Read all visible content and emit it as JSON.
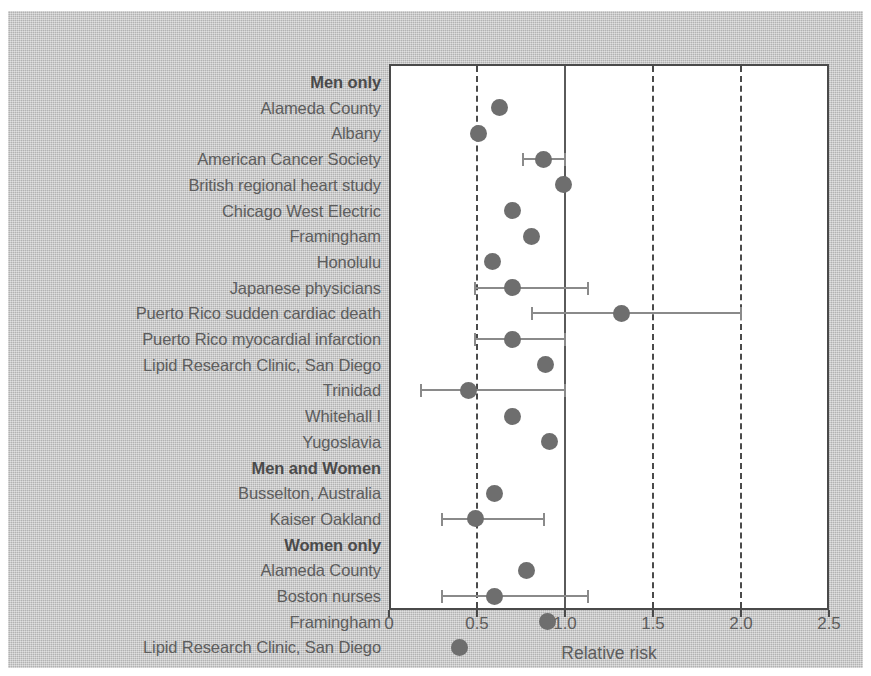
{
  "chart_data": {
    "type": "scatter",
    "title": "",
    "xlabel": "Relative risk",
    "ylabel": "",
    "xlim": [
      0,
      2.5
    ],
    "xticks": [
      0,
      0.5,
      1.0,
      1.5,
      2.0,
      2.5
    ],
    "xtick_labels": [
      "0",
      "0.5",
      "1.0",
      "1.5",
      "2.0",
      "2.5"
    ],
    "grid": "vertical dashed gridlines at 0.5, 1.5, 2.0; solid reference line at 1.0",
    "legend": "none",
    "reference_line": 1.0,
    "orientation": "horizontal forest plot, one row per study",
    "rows": [
      {
        "label": "Men only",
        "type": "heading"
      },
      {
        "label": "Alameda County",
        "type": "study",
        "value": 0.63
      },
      {
        "label": "Albany",
        "type": "study",
        "value": 0.51
      },
      {
        "label": "American Cancer Society",
        "type": "study",
        "value": 0.88,
        "ci_low": 0.76,
        "ci_high": 1.0
      },
      {
        "label": "British regional heart study",
        "type": "study",
        "value": 0.99
      },
      {
        "label": "Chicago West Electric",
        "type": "study",
        "value": 0.7
      },
      {
        "label": "Framingham",
        "type": "study",
        "value": 0.81
      },
      {
        "label": "Honolulu",
        "type": "study",
        "value": 0.59
      },
      {
        "label": "Japanese physicians",
        "type": "study",
        "value": 0.7,
        "ci_low": 0.49,
        "ci_high": 1.13
      },
      {
        "label": "Puerto Rico sudden cardiac death",
        "type": "study",
        "value": 1.32,
        "ci_low": 0.81,
        "ci_high": 2.0
      },
      {
        "label": "Puerto Rico myocardial infarction",
        "type": "study",
        "value": 0.7,
        "ci_low": 0.49,
        "ci_high": 1.0
      },
      {
        "label": "Lipid Research Clinic, San Diego",
        "type": "study",
        "value": 0.89
      },
      {
        "label": "Trinidad",
        "type": "study",
        "value": 0.45,
        "ci_low": 0.18,
        "ci_high": 1.0
      },
      {
        "label": "Whitehall I",
        "type": "study",
        "value": 0.7
      },
      {
        "label": "Yugoslavia",
        "type": "study",
        "value": 0.91
      },
      {
        "label": "Men and Women",
        "type": "heading"
      },
      {
        "label": "Busselton, Australia",
        "type": "study",
        "value": 0.6
      },
      {
        "label": "Kaiser Oakland",
        "type": "study",
        "value": 0.49,
        "ci_low": 0.3,
        "ci_high": 0.88
      },
      {
        "label": "Women only",
        "type": "heading"
      },
      {
        "label": "Alameda County",
        "type": "study",
        "value": 0.78
      },
      {
        "label": "Boston nurses",
        "type": "study",
        "value": 0.6,
        "ci_low": 0.3,
        "ci_high": 1.13
      },
      {
        "label": "Framingham",
        "type": "study",
        "value": 0.9
      },
      {
        "label": "Lipid Research Clinic, San Diego",
        "type": "study",
        "value": 0.4
      }
    ]
  },
  "colors": {
    "plate_background": "#c3c3c3",
    "plot_background": "#ffffff",
    "axis": "#4a4a4a",
    "text": "#5d5d5d",
    "marker": "#6e6e6e",
    "ci_line": "#8a8a8a"
  }
}
